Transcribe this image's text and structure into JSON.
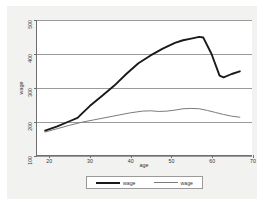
{
  "chart_data": {
    "type": "line",
    "title": "",
    "xlabel": "age",
    "ylabel": "wage",
    "xlim": [
      17,
      70
    ],
    "ylim": [
      100,
      500
    ],
    "grid": true,
    "legend_position": "bottom",
    "xticks": [
      20,
      30,
      40,
      50,
      60,
      70
    ],
    "yticks": [
      100,
      200,
      300,
      400,
      500
    ],
    "series": [
      {
        "name": "wage",
        "style": "thick-black",
        "color": "#1a1a1a",
        "x": [
          19,
          22,
          25,
          27,
          28,
          30,
          33,
          36,
          39,
          42,
          45,
          48,
          51,
          53,
          55,
          57,
          58,
          60,
          62,
          63,
          65,
          67
        ],
        "values": [
          172,
          185,
          200,
          210,
          222,
          245,
          275,
          305,
          340,
          372,
          395,
          415,
          432,
          440,
          445,
          450,
          448,
          400,
          335,
          330,
          340,
          348
        ]
      },
      {
        "name": "wage",
        "style": "thin-gray",
        "color": "#7a7a7a",
        "x": [
          19,
          22,
          25,
          28,
          31,
          34,
          37,
          40,
          43,
          45,
          47,
          49,
          51,
          53,
          55,
          57,
          59,
          61,
          63,
          65,
          67
        ],
        "values": [
          168,
          178,
          188,
          197,
          204,
          211,
          218,
          225,
          230,
          231,
          229,
          230,
          233,
          237,
          238,
          237,
          232,
          226,
          220,
          215,
          212
        ]
      }
    ]
  },
  "legend": {
    "items": [
      {
        "label": "wage"
      },
      {
        "label": "wage"
      }
    ]
  }
}
